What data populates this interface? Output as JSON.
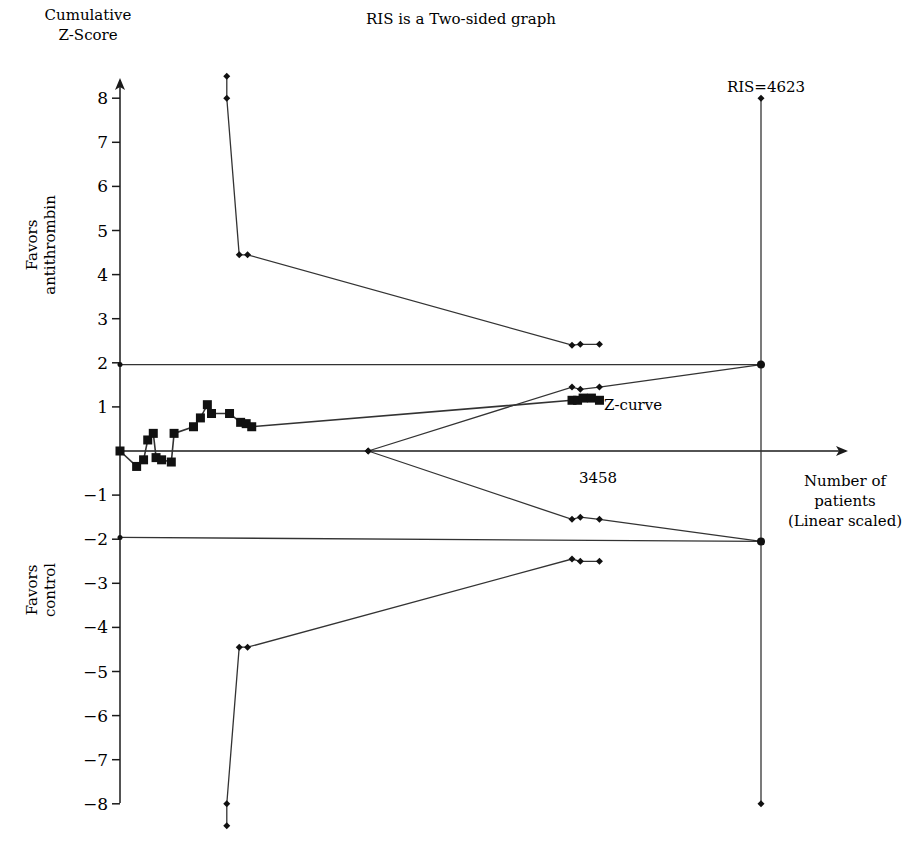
{
  "chart_data": {
    "type": "line",
    "title": "RIS is a Two-sided graph",
    "ylabel": "Cumulative Z-Score",
    "xlabel": "Number of patients (Linear scaled)",
    "ylim": [
      -8.5,
      8.5
    ],
    "xlim": [
      0,
      5000
    ],
    "grid": false,
    "y_ticks": [
      8,
      7,
      6,
      5,
      4,
      3,
      2,
      1,
      -1,
      -2,
      -3,
      -4,
      -5,
      -6,
      -7,
      -8
    ],
    "annotations": {
      "favors_top": "Favors antithrombin",
      "favors_bottom": "Favors control",
      "ris_label": "RIS=4623",
      "ris_value": 4623,
      "accrued_label": "3458",
      "accrued_value": 3458,
      "zcurve_label": "Z-curve"
    },
    "series": [
      {
        "name": "Z-curve",
        "marker": "square",
        "points": [
          [
            0,
            0.0
          ],
          [
            120,
            -0.35
          ],
          [
            170,
            -0.2
          ],
          [
            200,
            0.25
          ],
          [
            240,
            0.4
          ],
          [
            260,
            -0.15
          ],
          [
            300,
            -0.2
          ],
          [
            370,
            -0.25
          ],
          [
            390,
            0.4
          ],
          [
            530,
            0.55
          ],
          [
            580,
            0.75
          ],
          [
            630,
            1.05
          ],
          [
            660,
            0.85
          ],
          [
            790,
            0.85
          ],
          [
            870,
            0.65
          ],
          [
            910,
            0.62
          ],
          [
            950,
            0.55
          ],
          [
            3260,
            1.15
          ],
          [
            3300,
            1.15
          ],
          [
            3340,
            1.2
          ],
          [
            3400,
            1.2
          ],
          [
            3458,
            1.15
          ]
        ]
      },
      {
        "name": "Upper alpha-spending boundary",
        "marker": "diamond",
        "points": [
          [
            770,
            8.5
          ],
          [
            770,
            8.0
          ],
          [
            860,
            4.45
          ],
          [
            920,
            4.45
          ],
          [
            3260,
            2.4
          ],
          [
            3320,
            2.42
          ],
          [
            3458,
            2.42
          ]
        ]
      },
      {
        "name": "Lower alpha-spending boundary",
        "marker": "diamond",
        "points": [
          [
            770,
            -8.5
          ],
          [
            770,
            -8.0
          ],
          [
            860,
            -4.45
          ],
          [
            920,
            -4.45
          ],
          [
            3260,
            -2.45
          ],
          [
            3320,
            -2.5
          ],
          [
            3458,
            -2.5
          ]
        ]
      },
      {
        "name": "Upper futility boundary",
        "marker": "diamond",
        "points": [
          [
            1790,
            0.0
          ],
          [
            3260,
            1.45
          ],
          [
            3320,
            1.4
          ],
          [
            3458,
            1.45
          ],
          [
            4623,
            1.96
          ]
        ]
      },
      {
        "name": "Lower futility boundary",
        "marker": "diamond",
        "points": [
          [
            1790,
            0.0
          ],
          [
            3260,
            -1.55
          ],
          [
            3320,
            -1.5
          ],
          [
            3458,
            -1.55
          ],
          [
            4623,
            -2.05
          ]
        ]
      },
      {
        "name": "Conventional boundary +1.96",
        "marker": "none",
        "points": [
          [
            0,
            1.96
          ],
          [
            4623,
            1.96
          ]
        ]
      },
      {
        "name": "Conventional boundary -1.96",
        "marker": "none",
        "points": [
          [
            0,
            -1.96
          ],
          [
            4623,
            -2.05
          ]
        ]
      },
      {
        "name": "RIS line",
        "marker": "diamond",
        "points": [
          [
            4623,
            8.0
          ],
          [
            4623,
            -8.0
          ]
        ]
      }
    ]
  }
}
